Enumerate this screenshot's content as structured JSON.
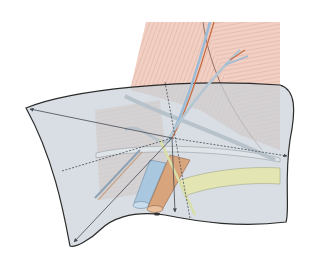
{
  "figure": {
    "type": "anatomical-diagram",
    "labels": []
  },
  "colors": {
    "background": "#ffffff",
    "muscle": "#efc9bd",
    "muscle_lines": "#c98d80",
    "plane_fill": "#c9d1d8",
    "plane_stroke": "#2b2b2b",
    "vein": "#a9c8e0",
    "artery": "#d8a47c",
    "nerve": "#d9dea6",
    "tendon_yellow": "#e3e6b3",
    "arrow": "#444a52"
  }
}
